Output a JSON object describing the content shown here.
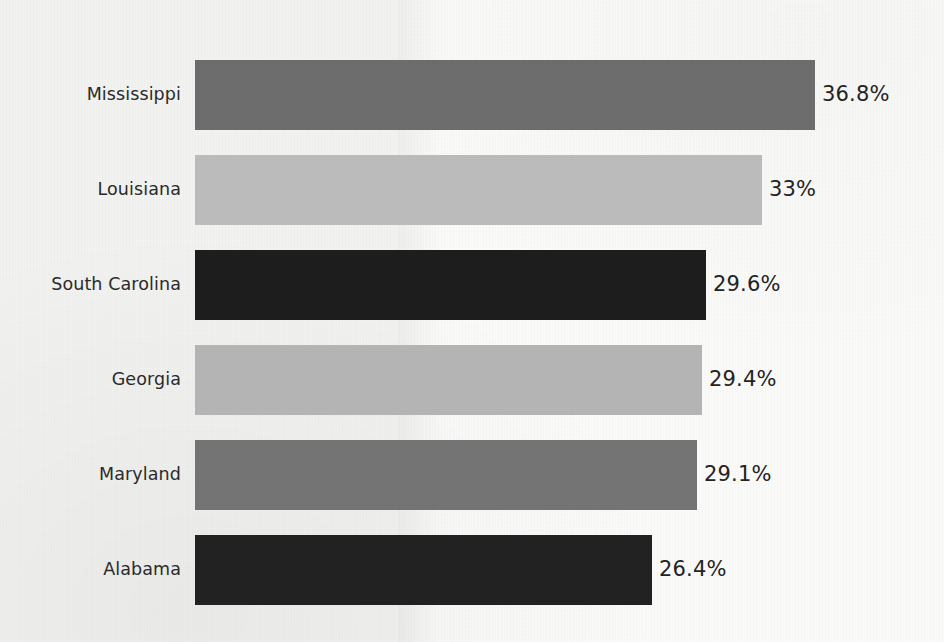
{
  "chart_data": {
    "type": "bar",
    "orientation": "horizontal",
    "title": "",
    "subtitle": "",
    "xlabel": "",
    "ylabel": "",
    "grid": false,
    "legend": false,
    "xlim": [
      0,
      42.6
    ],
    "categories": [
      "Mississippi",
      "Louisiana",
      "South Carolina",
      "Georgia",
      "Maryland",
      "Alabama"
    ],
    "values": [
      36.8,
      33,
      29.6,
      29.4,
      29.1,
      26.4
    ],
    "value_labels": [
      "36.8%",
      "33%",
      "29.6%",
      "29.4%",
      "29.1%",
      "26.4%"
    ],
    "bar_colors": [
      "#6e6e6e",
      "#bdbdbd",
      "#1e1e1e",
      "#b6b6b6",
      "#757575",
      "#222222"
    ],
    "bars": [
      {
        "category": "Mississippi",
        "value": 36.8,
        "label": "36.8%",
        "color": "#6e6e6e",
        "top": 60,
        "width": 620
      },
      {
        "category": "Louisiana",
        "value": 33,
        "label": "33%",
        "color": "#bdbdbd",
        "top": 155,
        "width": 567
      },
      {
        "category": "South Carolina",
        "value": 29.6,
        "label": "29.6%",
        "color": "#1e1e1e",
        "top": 250,
        "width": 511
      },
      {
        "category": "Georgia",
        "value": 29.4,
        "label": "29.4%",
        "color": "#b6b6b6",
        "top": 345,
        "width": 507
      },
      {
        "category": "Maryland",
        "value": 29.1,
        "label": "29.1%",
        "color": "#757575",
        "top": 440,
        "width": 502
      },
      {
        "category": "Alabama",
        "value": 26.4,
        "label": "26.4%",
        "color": "#222222",
        "top": 535,
        "width": 457
      }
    ]
  },
  "style": {
    "background": "#f6f6f4",
    "label_color": "#2b2b2b",
    "value_color": "#242424"
  }
}
